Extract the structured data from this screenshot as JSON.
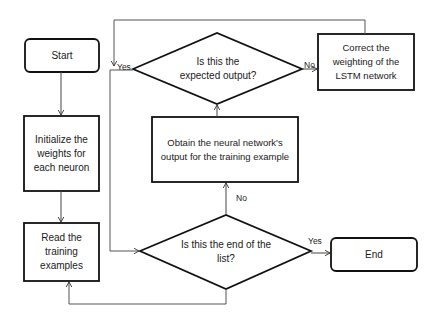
{
  "diagram": {
    "type": "flowchart",
    "nodes": {
      "start": {
        "label": "Start",
        "shape": "rounded-rect"
      },
      "init": {
        "label": "Initialize the weights for each neuron",
        "shape": "rect"
      },
      "read": {
        "label": "Read the training examples",
        "shape": "rect"
      },
      "end_check": {
        "label": "Is this the end of the list?",
        "shape": "diamond"
      },
      "obtain": {
        "label": "Obtain the neural network's output for the training example",
        "shape": "rect"
      },
      "expected_check": {
        "label": "Is this the expected output?",
        "shape": "diamond"
      },
      "correct": {
        "label": "Correct the weighting of the LSTM network",
        "shape": "rect"
      },
      "end": {
        "label": "End",
        "shape": "rounded-rect"
      }
    },
    "edge_labels": {
      "expected_yes": "Yes",
      "expected_no": "No",
      "end_no": "No",
      "end_yes": "Yes"
    },
    "edges": [
      {
        "from": "start",
        "to": "init"
      },
      {
        "from": "init",
        "to": "read"
      },
      {
        "from": "read",
        "to": "end_check"
      },
      {
        "from": "end_check",
        "to": "obtain",
        "label": "No"
      },
      {
        "from": "end_check",
        "to": "end",
        "label": "Yes"
      },
      {
        "from": "obtain",
        "to": "expected_check"
      },
      {
        "from": "expected_check",
        "to": "correct",
        "label": "No"
      },
      {
        "from": "expected_check",
        "to": "end_check",
        "label": "Yes"
      },
      {
        "from": "correct",
        "to": "expected_check_yes_path"
      },
      {
        "from": "end_check",
        "to": "read"
      }
    ]
  }
}
